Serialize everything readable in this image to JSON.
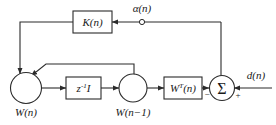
{
  "figure": {
    "type": "block-diagram",
    "background_color": "#ffffff",
    "line_color": "#2b2b2b",
    "text_color": "#1a1a1a"
  },
  "blocks": {
    "gain": {
      "label": "K(n)",
      "shape": "rectangle"
    },
    "delay": {
      "label_base": "z",
      "label_exp": "-1",
      "label_tail": "I",
      "shape": "rectangle"
    },
    "weight_transpose": {
      "label_base": "W",
      "label_exp": "T",
      "label_tail": "(n)",
      "shape": "rectangle"
    }
  },
  "nodes": {
    "weight_current": {
      "label": "W(n)",
      "shape": "circle"
    },
    "weight_delayed": {
      "label_base": "W",
      "label_tail": "(n−1)",
      "shape": "circle"
    },
    "summer": {
      "glyph": "Σ",
      "shape": "circle",
      "input_minus": "−",
      "input_plus": "+"
    }
  },
  "signals": {
    "alpha": {
      "label": "α(n)",
      "terminal": "open-circle"
    },
    "desired": {
      "label": "d(n)"
    }
  }
}
